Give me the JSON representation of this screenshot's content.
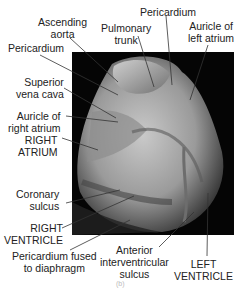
{
  "figure": {
    "caption_label": "(b)",
    "labels": [
      {
        "id": "ascending-aorta",
        "lines": [
          "Ascending",
          "aorta"
        ]
      },
      {
        "id": "pulmonary-trunk",
        "lines": [
          "Pulmonary",
          "trunk"
        ]
      },
      {
        "id": "pericardium-top",
        "lines": [
          "Pericardium"
        ]
      },
      {
        "id": "auricle-left-atrium",
        "lines": [
          "Auricle of",
          "left atrium"
        ]
      },
      {
        "id": "pericardium-left",
        "lines": [
          "Pericardium"
        ]
      },
      {
        "id": "superior-vena-cava",
        "lines": [
          "Superior",
          "vena cava"
        ]
      },
      {
        "id": "auricle-right-atrium",
        "lines": [
          "Auricle of",
          "right atrium"
        ]
      },
      {
        "id": "right-atrium",
        "lines": [
          "RIGHT",
          "ATRIUM"
        ]
      },
      {
        "id": "coronary-sulcus",
        "lines": [
          "Coronary",
          "sulcus"
        ]
      },
      {
        "id": "right-ventricle",
        "lines": [
          "RIGHT",
          "VENTRICLE"
        ]
      },
      {
        "id": "pericardium-fused",
        "lines": [
          "Pericardium fused",
          "to diaphragm"
        ]
      },
      {
        "id": "anterior-interventricular-sulcus",
        "lines": [
          "Anterior",
          "interventricular",
          "sulcus"
        ]
      },
      {
        "id": "left-ventricle",
        "lines": [
          "LEFT",
          "VENTRICLE"
        ]
      }
    ]
  }
}
